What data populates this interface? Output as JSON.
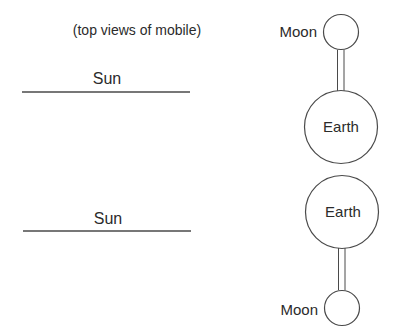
{
  "caption": "(top views of mobile)",
  "panels": [
    {
      "sun_label": "Sun",
      "moon_label": "Moon",
      "earth_label": "Earth",
      "arrangement": "moon-above-earth"
    },
    {
      "sun_label": "Sun",
      "moon_label": "Moon",
      "earth_label": "Earth",
      "arrangement": "earth-above-moon"
    }
  ],
  "colors": {
    "stroke": "#4a4a4a",
    "text": "#2b2b2b",
    "background": "#ffffff"
  }
}
